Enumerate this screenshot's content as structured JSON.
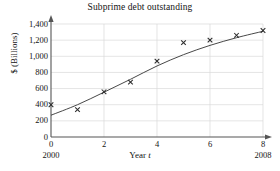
{
  "figure": {
    "title": "Subprime debt outstanding",
    "xlabel_prefix": "Year",
    "xlabel_var": "t",
    "ylabel": "$ (Billions)",
    "x_start_year": "2000",
    "x_end_year": "2008"
  },
  "chart_data": {
    "type": "scatter",
    "title": "Subprime debt outstanding",
    "xlabel": "Year t",
    "ylabel": "$ (Billions)",
    "xlim": [
      0,
      8
    ],
    "ylim": [
      0,
      1400
    ],
    "grid": true,
    "legend": "none",
    "marker": "x",
    "x_tick_labels": [
      "0",
      "2",
      "4",
      "6",
      "8"
    ],
    "x_ticks": [
      0,
      2,
      4,
      6,
      8
    ],
    "y_tick_labels": [
      "0",
      "200",
      "400",
      "600",
      "800",
      "1,000",
      "1,200",
      "1,400"
    ],
    "y_ticks": [
      0,
      200,
      400,
      600,
      800,
      1000,
      1200,
      1400
    ],
    "x_axis_end_labels": [
      "2000",
      "2008"
    ],
    "series": [
      {
        "name": "Subprime debt outstanding",
        "kind": "points",
        "x": [
          0,
          1,
          2,
          3,
          4,
          5,
          6,
          7,
          8
        ],
        "values": [
          400,
          340,
          560,
          680,
          940,
          1170,
          1200,
          1260,
          1320
        ]
      },
      {
        "name": "Fitted logistic curve",
        "kind": "line",
        "x": [
          0,
          1,
          2,
          3,
          4,
          5,
          6,
          7,
          8
        ],
        "values": [
          270,
          400,
          555,
          715,
          880,
          1020,
          1135,
          1230,
          1310
        ]
      }
    ]
  },
  "colors": {
    "axis": "#555555",
    "grid": "#d8d8d8",
    "curve": "#333333",
    "marker": "#2b2b2b",
    "text": "#141414",
    "background": "#ffffff"
  }
}
